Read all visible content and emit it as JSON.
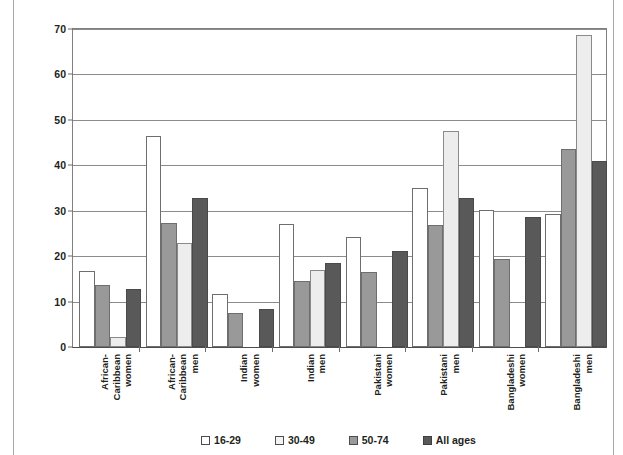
{
  "chart_data": {
    "type": "bar",
    "title": "",
    "xlabel": "",
    "ylabel": "Unemployment",
    "ylim": [
      0,
      70
    ],
    "ytick_step": 10,
    "yticks": [
      "0",
      "10",
      "20",
      "30",
      "40",
      "50",
      "60",
      "70"
    ],
    "grid": true,
    "legend_position": "bottom",
    "categories": [
      "African-Caribbean women",
      "African-Caribbean men",
      "Indian women",
      "Indian men",
      "Pakistani women",
      "Pakistani men",
      "Bangladeshi women",
      "Bangladeshi men"
    ],
    "category_lines": [
      [
        "African-",
        "Caribbean",
        "women"
      ],
      [
        "African-",
        "Caribbean",
        "men"
      ],
      [
        "Indian",
        "women"
      ],
      [
        "Indian",
        "men"
      ],
      [
        "Pakistani",
        "women"
      ],
      [
        "Pakistani",
        "men"
      ],
      [
        "Bangladeshi",
        "women"
      ],
      [
        "Bangladeshi",
        "men"
      ]
    ],
    "series": [
      {
        "name": "16-29",
        "color": "#ffffff",
        "values": [
          16.7,
          46.4,
          11.6,
          27.1,
          24.2,
          34.9,
          30.1,
          29.2
        ]
      },
      {
        "name": "50-74",
        "color": "#999999",
        "values": [
          13.6,
          27.4,
          7.5,
          14.5,
          16.5,
          26.9,
          19.3,
          43.6
        ]
      },
      {
        "name": "30-49",
        "color": "#ededed",
        "values": [
          2.2,
          23.0,
          0,
          16.9,
          0,
          47.5,
          0,
          68.7
        ]
      },
      {
        "name": "All ages",
        "color": "#595959",
        "values": [
          12.8,
          32.8,
          8.4,
          18.6,
          21.2,
          32.7,
          28.7,
          40.9
        ]
      }
    ],
    "legend_order": [
      "16-29",
      "30-49",
      "50-74",
      "All ages"
    ]
  },
  "legend": [
    {
      "label": "16-29",
      "swatch": "c16"
    },
    {
      "label": "30-49",
      "swatch": "c30"
    },
    {
      "label": "50-74",
      "swatch": "c50"
    },
    {
      "label": "All ages",
      "swatch": "call"
    }
  ],
  "axis": {
    "y_title": "Unemployment"
  }
}
